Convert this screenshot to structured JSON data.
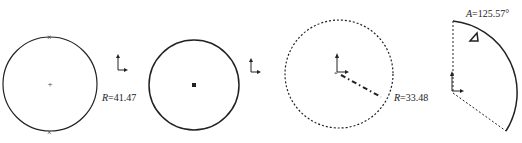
{
  "figures": [
    {
      "id": "circle-with-points",
      "label_prefix": "R",
      "label_eq": "=",
      "label_value": "41.47"
    },
    {
      "id": "circle-center-point",
      "label_prefix": "",
      "label_eq": "",
      "label_value": ""
    },
    {
      "id": "dashed-circle-radius",
      "label_prefix": "R",
      "label_eq": "=",
      "label_value": "33.48"
    },
    {
      "id": "arc-sector-angle",
      "label_prefix": "A",
      "label_eq": "=",
      "label_value": "125.57°"
    }
  ],
  "colors": {
    "stroke": "#222222",
    "background": "#ffffff"
  }
}
